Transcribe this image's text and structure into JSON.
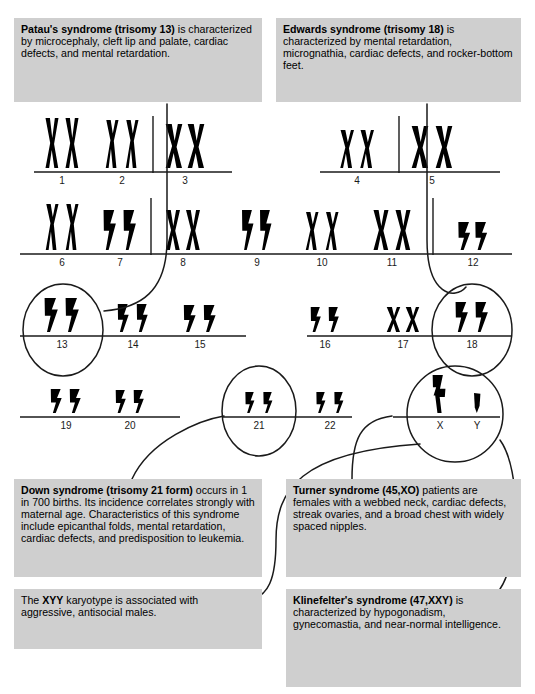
{
  "colors": {
    "page_background": "#ffffff",
    "infobox_background": "#cfcfcf",
    "chromosome": "#000000",
    "line": "#1a1a1a",
    "text": "#000000"
  },
  "infoboxes": [
    {
      "id": "patau",
      "name": "patau-syndrome-box",
      "title": "Patau's syndrome (trisomy 13)",
      "body": " is characterized by microcephaly, cleft lip and palate, cardiac defects, and mental retardation.",
      "chromosome_count": 3,
      "chromosome_type": "acrocentric",
      "x": 14,
      "y": 18,
      "w": 248,
      "h": 84
    },
    {
      "id": "edwards",
      "name": "edwards-syndrome-box",
      "title": "Edwards syndrome (trisomy 18)",
      "body": " is characterized by mental retardation, micrognathia, cardiac defects, and rocker-bottom feet.",
      "chromosome_count": 3,
      "chromosome_type": "acrocentric",
      "x": 276,
      "y": 18,
      "w": 245,
      "h": 84
    },
    {
      "id": "down",
      "name": "down-syndrome-box",
      "title": "Down syndrome (trisomy 21 form)",
      "body": " occurs in 1 in 700 births.  Its incidence correlates strongly with maternal age.  Characteristics of this syndrome include epicanthal folds, mental retardation, cardiac defects, and predisposition to leukemia.",
      "chromosome_count": 3,
      "chromosome_type": "small-acrocentric",
      "x": 14,
      "y": 479,
      "w": 248,
      "h": 98
    },
    {
      "id": "turner",
      "name": "turner-syndrome-box",
      "title": "Turner syndrome (45,XO)",
      "body": " patients are females with a webbed neck, cardiac defects, streak ovaries, and a broad chest with widely spaced nipples.",
      "chromosome_count": 1,
      "chromosome_type": "x-only",
      "x": 286,
      "y": 479,
      "w": 235,
      "h": 98
    },
    {
      "id": "xyy",
      "name": "xyy-karyotype-box",
      "title": "XYY",
      "body_before": "The ",
      "body": " karyotype is associated with aggressive, antisocial males.",
      "chromosome_count": 3,
      "chromosome_type": "xyy",
      "x": 14,
      "y": 589,
      "w": 248,
      "h": 60
    },
    {
      "id": "klinefelter",
      "name": "klinefelter-syndrome-box",
      "title": "Klinefelter's syndrome (47,XXY)",
      "body": " is characterized by hypogonadism, gynecomastia, and near-normal intelligence.",
      "chromosome_count": 3,
      "chromosome_type": "xxy",
      "x": 286,
      "y": 589,
      "w": 235,
      "h": 98
    }
  ],
  "karyotype": {
    "rows": [
      {
        "index": 0,
        "baseline_y": 172,
        "segments": [
          {
            "x1": 34,
            "x2": 153
          },
          {
            "x1": 153,
            "x2": 232
          },
          {
            "x1": 320,
            "x2": 399
          },
          {
            "x1": 399,
            "x2": 500
          }
        ],
        "dividers": [
          153,
          399
        ],
        "groups": [
          {
            "label": "1",
            "cx": 62,
            "pairs": 2,
            "shape": "metacentric",
            "h": 50,
            "w": 13,
            "gap": 20
          },
          {
            "label": "2",
            "cx": 122,
            "pairs": 2,
            "shape": "submeta-long",
            "h": 48,
            "w": 13,
            "gap": 20
          },
          {
            "label": "3",
            "cx": 185,
            "pairs": 2,
            "shape": "metacentric-fat",
            "h": 44,
            "w": 16,
            "gap": 22
          },
          {
            "label": "4",
            "cx": 357,
            "pairs": 2,
            "shape": "submeta-short",
            "h": 38,
            "w": 14,
            "gap": 20
          },
          {
            "label": "5",
            "cx": 432,
            "pairs": 2,
            "shape": "metacentric-fat",
            "h": 42,
            "w": 16,
            "gap": 24
          }
        ]
      },
      {
        "index": 1,
        "baseline_y": 254,
        "segments": [
          {
            "x1": 20,
            "x2": 151
          },
          {
            "x1": 151,
            "x2": 433
          },
          {
            "x1": 433,
            "x2": 512
          }
        ],
        "dividers": [
          151,
          433
        ],
        "groups": [
          {
            "label": "6",
            "cx": 62,
            "pairs": 2,
            "shape": "submeta-long",
            "h": 46,
            "w": 13,
            "gap": 20
          },
          {
            "label": "7",
            "cx": 120,
            "pairs": 2,
            "shape": "acrocentric",
            "h": 40,
            "w": 14,
            "gap": 20
          },
          {
            "label": "8",
            "cx": 183,
            "pairs": 2,
            "shape": "metacentric",
            "h": 40,
            "w": 14,
            "gap": 20
          },
          {
            "label": "9",
            "cx": 257,
            "pairs": 2,
            "shape": "acrocentric",
            "h": 40,
            "w": 13,
            "gap": 18
          },
          {
            "label": "10",
            "cx": 322,
            "pairs": 2,
            "shape": "submeta-short",
            "h": 38,
            "w": 13,
            "gap": 20
          },
          {
            "label": "11",
            "cx": 392,
            "pairs": 2,
            "shape": "metacentric",
            "h": 40,
            "w": 15,
            "gap": 22
          },
          {
            "label": "12",
            "cx": 473,
            "pairs": 2,
            "shape": "small-acrocentric",
            "h": 28,
            "w": 14,
            "gap": 17
          }
        ]
      },
      {
        "index": 2,
        "baseline_y": 336,
        "segments": [
          {
            "x1": 20,
            "x2": 246
          },
          {
            "x1": 307,
            "x2": 512
          }
        ],
        "dividers": [],
        "groups": [
          {
            "label": "13",
            "cx": 62,
            "pairs": 2,
            "shape": "acrocentric",
            "h": 34,
            "w": 15,
            "gap": 21
          },
          {
            "label": "14",
            "cx": 133,
            "pairs": 2,
            "shape": "small-acrocentric",
            "h": 28,
            "w": 13,
            "gap": 19
          },
          {
            "label": "15",
            "cx": 200,
            "pairs": 2,
            "shape": "small-acrocentric",
            "h": 27,
            "w": 14,
            "gap": 20
          },
          {
            "label": "16",
            "cx": 325,
            "pairs": 2,
            "shape": "small-acrocentric",
            "h": 25,
            "w": 12,
            "gap": 18
          },
          {
            "label": "17",
            "cx": 403,
            "pairs": 2,
            "shape": "small-meta",
            "h": 25,
            "w": 13,
            "gap": 19
          },
          {
            "label": "18",
            "cx": 472,
            "pairs": 2,
            "shape": "acrocentric",
            "h": 30,
            "w": 14,
            "gap": 20
          }
        ]
      },
      {
        "index": 3,
        "baseline_y": 417,
        "segments": [
          {
            "x1": 20,
            "x2": 180
          },
          {
            "x1": 222,
            "x2": 352
          },
          {
            "x1": 393,
            "x2": 500
          }
        ],
        "dividers": [],
        "groups": [
          {
            "label": "19",
            "cx": 66,
            "pairs": 2,
            "shape": "small-acrocentric",
            "h": 24,
            "w": 13,
            "gap": 19
          },
          {
            "label": "20",
            "cx": 130,
            "pairs": 2,
            "shape": "small-acrocentric",
            "h": 23,
            "w": 12,
            "gap": 18
          },
          {
            "label": "21",
            "cx": 259,
            "pairs": 2,
            "shape": "tiny-acrocentric",
            "h": 21,
            "w": 11,
            "gap": 18
          },
          {
            "label": "22",
            "cx": 330,
            "pairs": 2,
            "shape": "tiny-acrocentric",
            "h": 21,
            "w": 11,
            "gap": 18
          },
          {
            "label": "X",
            "cx": 440,
            "pairs": 1,
            "shape": "x-large",
            "h": 38,
            "w": 16,
            "gap": 0
          },
          {
            "label": "Y",
            "cx": 477,
            "pairs": 1,
            "shape": "y-small",
            "h": 20,
            "w": 10,
            "gap": 0
          }
        ]
      }
    ],
    "highlight_circles": [
      {
        "name": "circle-chromosome-13",
        "cx": 63,
        "cy": 330,
        "rx": 40,
        "ry": 46
      },
      {
        "name": "circle-chromosome-18",
        "cx": 472,
        "cy": 330,
        "rx": 40,
        "ry": 46
      },
      {
        "name": "circle-chromosome-21",
        "cx": 259,
        "cy": 411,
        "rx": 37,
        "ry": 45
      },
      {
        "name": "circle-chromosome-xy",
        "cx": 455,
        "cy": 414,
        "rx": 48,
        "ry": 48
      }
    ],
    "connectors": [
      {
        "name": "connector-patau-to-13",
        "d": "M 167 104 L 167 240 C 167 292 140 308 104 311"
      },
      {
        "name": "connector-edwards-to-18",
        "d": "M 427 104 L 427 240 C 427 296 455 300 466 287"
      },
      {
        "name": "connector-down-to-21",
        "d": "M 132 479 C 150 440 200 420 224 416"
      },
      {
        "name": "connector-turner-to-x",
        "d": "M 352 479 C 352 440 360 420 392 416"
      },
      {
        "name": "connector-klinefelter-to-xy",
        "d": "M 500 589 C 520 560 522 470 500 440"
      },
      {
        "name": "connector-xyy-to-y",
        "d": "M 250 600 C 268 596 276 580 276 540 C 276 490 300 452 420 444"
      }
    ]
  }
}
